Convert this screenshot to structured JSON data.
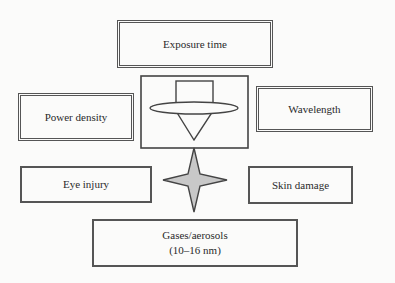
{
  "diagram": {
    "center_icon": "laser-source-icon",
    "connector_icon": "four-point-star-icon",
    "colors": {
      "border": "#555555",
      "star_fill": "#c8c8c8",
      "background": "#fbfbfa"
    },
    "nodes": {
      "exposure_time": "Exposure time",
      "power_density": "Power density",
      "wavelength": "Wavelength",
      "eye_injury": "Eye injury",
      "skin_damage": "Skin damage",
      "gases_line1": "Gases/aerosols",
      "gases_line2": "(10–16 nm)"
    }
  }
}
